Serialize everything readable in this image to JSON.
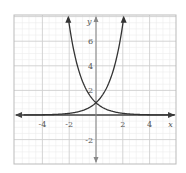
{
  "chart_data": {
    "type": "line",
    "title": "",
    "xlabel": "x",
    "ylabel": "y",
    "xlim": [
      -5.5,
      6.0
    ],
    "ylim": [
      -4.0,
      8.0
    ],
    "grid": true,
    "major_step": 2,
    "minor_step": 0.5,
    "x_ticks": [
      -4,
      -2,
      2,
      4
    ],
    "x_tick_labels": [
      "-4",
      "-2",
      "2",
      "4"
    ],
    "y_ticks": [
      -2,
      2,
      4,
      6
    ],
    "y_tick_labels": [
      "-2",
      "2",
      "4",
      "6"
    ],
    "series": [
      {
        "name": "increasing exponential",
        "formula": "y = e^x",
        "x": [
          -5.5,
          -4,
          -2,
          -1,
          0,
          1,
          2,
          2.1
        ],
        "values": [
          0.004,
          0.018,
          0.135,
          0.368,
          1,
          2.718,
          7.389,
          8.0
        ]
      },
      {
        "name": "decreasing exponential",
        "formula": "y = e^-x",
        "x": [
          -2.1,
          -2,
          -1,
          0,
          1,
          2,
          4,
          6.0
        ],
        "values": [
          8.0,
          7.389,
          2.718,
          1,
          0.368,
          0.135,
          0.018,
          0.002
        ]
      }
    ],
    "annotations": [
      {
        "label": "intersection",
        "x": 0,
        "y": 1
      }
    ]
  },
  "axis": {
    "x_label": "x",
    "y_label": "y"
  },
  "colors": {
    "curve": "#333333",
    "axis": "#444444",
    "grid_major": "#cfcfcf",
    "grid_minor": "#ececec",
    "border": "#bbbbbb"
  }
}
